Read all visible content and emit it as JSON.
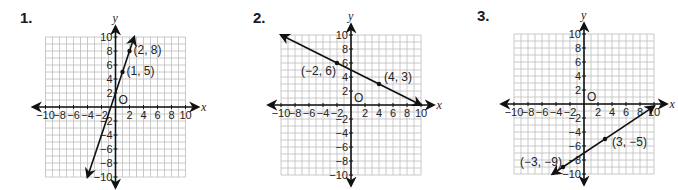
{
  "chart_data": [
    {
      "type": "line",
      "problem_label": "1.",
      "title": "",
      "xlabel": "x",
      "ylabel": "y",
      "origin_label": "O",
      "xlim": [
        -10,
        10
      ],
      "ylim": [
        -10,
        10
      ],
      "grid": true,
      "x_ticks": [
        "-10",
        "-8",
        "-6",
        "-4",
        "-2",
        "2",
        "4",
        "6",
        "8",
        "10"
      ],
      "y_ticks": [
        "10",
        "8",
        "6",
        "4",
        "2",
        "-2",
        "-4",
        "-6",
        "-8",
        "-10"
      ],
      "points": [
        {
          "x": 2,
          "y": 8,
          "label": "(2, 8)"
        },
        {
          "x": 1,
          "y": 5,
          "label": "(1, 5)"
        }
      ],
      "line": {
        "from": [
          -4,
          -10
        ],
        "to": [
          2.67,
          10
        ],
        "arrows": "both"
      },
      "layout": {
        "ox": 115.5,
        "oy": 107,
        "unit": 7,
        "label_x": 20,
        "label_y": 11
      }
    },
    {
      "type": "line",
      "problem_label": "2.",
      "title": "",
      "xlabel": "x",
      "ylabel": "y",
      "origin_label": "O",
      "xlim": [
        -10,
        10
      ],
      "ylim": [
        -10,
        10
      ],
      "grid": true,
      "x_ticks": [
        "-10",
        "-8",
        "-6",
        "-4",
        "-2",
        "2",
        "4",
        "6",
        "8",
        "10"
      ],
      "y_ticks": [
        "10",
        "8",
        "6",
        "4",
        "2",
        "-2",
        "-4",
        "-6",
        "-8",
        "-10"
      ],
      "points": [
        {
          "x": -2,
          "y": 6,
          "label": "(−2, 6)"
        },
        {
          "x": 4,
          "y": 3,
          "label": "(4, 3)"
        }
      ],
      "line": {
        "from": [
          -10,
          10
        ],
        "to": [
          10,
          0
        ],
        "arrows": "both"
      },
      "layout": {
        "ox": 351,
        "oy": 105,
        "unit": 7,
        "label_x": 253,
        "label_y": 11
      }
    },
    {
      "type": "line",
      "problem_label": "3.",
      "title": "",
      "xlabel": "x",
      "ylabel": "y",
      "origin_label": "O",
      "xlim": [
        -10,
        10
      ],
      "ylim": [
        -10,
        10
      ],
      "grid": true,
      "x_ticks": [
        "-10",
        "-8",
        "-6",
        "-4",
        "-2",
        "2",
        "4",
        "6",
        "8",
        "10"
      ],
      "y_ticks": [
        "10",
        "8",
        "6",
        "4",
        "2",
        "-2",
        "-4",
        "-6",
        "-8",
        "-10"
      ],
      "points": [
        {
          "x": 3,
          "y": -5,
          "label": "(3, −5)"
        },
        {
          "x": -3,
          "y": -9,
          "label": "(−3, −9)"
        }
      ],
      "line": {
        "from": [
          -4.5,
          -10
        ],
        "to": [
          10,
          -0.33
        ],
        "arrows": "both"
      },
      "layout": {
        "ox": 584,
        "oy": 104,
        "unit": 7,
        "label_x": 477,
        "label_y": 9
      }
    }
  ]
}
